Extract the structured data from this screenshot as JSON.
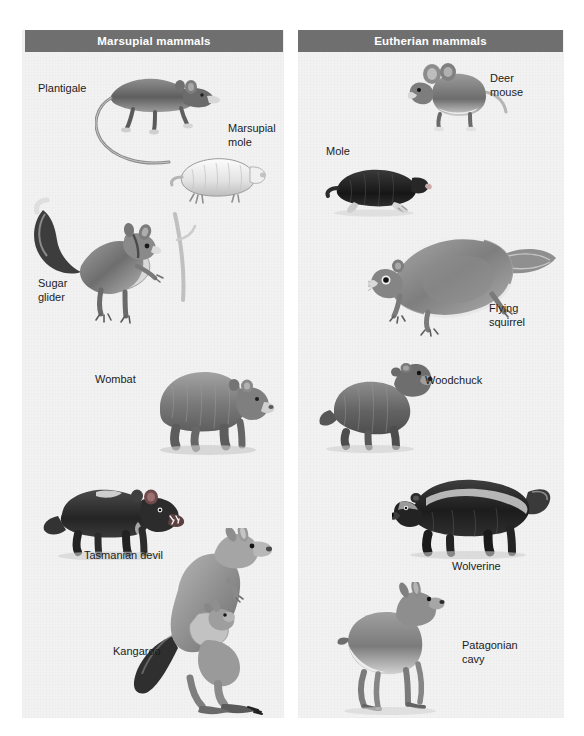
{
  "figure": {
    "type": "comparative-illustration",
    "panel_bg": "#f2f2f2",
    "header_bg": "#6f6f6f",
    "header_text_color": "#ffffff",
    "label_text_color": "#1c1c1c"
  },
  "panels": [
    {
      "id": "marsupial",
      "header": "Marsupial mammals",
      "organisms": [
        {
          "name": "Plantigale",
          "label": "Plantigale"
        },
        {
          "name": "Marsupial mole",
          "label": "Marsupial\nmole"
        },
        {
          "name": "Sugar glider",
          "label": "Sugar\nglider"
        },
        {
          "name": "Wombat",
          "label": "Wombat"
        },
        {
          "name": "Tasmanian devil",
          "label": "Tasmanian devil"
        },
        {
          "name": "Kangaroo",
          "label": "Kangaroo"
        }
      ]
    },
    {
      "id": "eutherian",
      "header": "Eutherian mammals",
      "organisms": [
        {
          "name": "Deer mouse",
          "label": "Deer\nmouse"
        },
        {
          "name": "Mole",
          "label": "Mole"
        },
        {
          "name": "Flying squirrel",
          "label": "Flying\nsquirrel"
        },
        {
          "name": "Woodchuck",
          "label": "Woodchuck"
        },
        {
          "name": "Wolverine",
          "label": "Wolverine"
        },
        {
          "name": "Patagonian cavy",
          "label": "Patagonian\ncavy"
        }
      ]
    }
  ]
}
